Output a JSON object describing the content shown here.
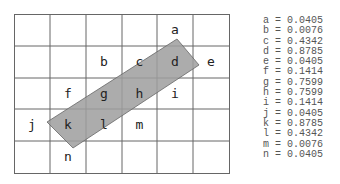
{
  "grid": {
    "cols": 6,
    "rows": 5
  },
  "cells": [
    {
      "id": "a",
      "label": "a",
      "col": 4,
      "row": 0
    },
    {
      "id": "b",
      "label": "b",
      "col": 2,
      "row": 1
    },
    {
      "id": "c",
      "label": "c",
      "col": 3,
      "row": 1
    },
    {
      "id": "d",
      "label": "d",
      "col": 4,
      "row": 1
    },
    {
      "id": "e",
      "label": "e",
      "col": 5,
      "row": 1
    },
    {
      "id": "f",
      "label": "f",
      "col": 1,
      "row": 2
    },
    {
      "id": "g",
      "label": "g",
      "col": 2,
      "row": 2
    },
    {
      "id": "h",
      "label": "h",
      "col": 3,
      "row": 2
    },
    {
      "id": "i",
      "label": "i",
      "col": 4,
      "row": 2
    },
    {
      "id": "j",
      "label": "j",
      "col": 0,
      "row": 3
    },
    {
      "id": "k",
      "label": "k",
      "col": 1,
      "row": 3
    },
    {
      "id": "l",
      "label": "l",
      "col": 2,
      "row": 3
    },
    {
      "id": "m",
      "label": "m",
      "col": 3,
      "row": 3
    },
    {
      "id": "n",
      "label": "n",
      "col": 1,
      "row": 4
    }
  ],
  "legend": [
    {
      "key": "a",
      "text": "a = 0.0405"
    },
    {
      "key": "b",
      "text": "b = 0.0076"
    },
    {
      "key": "c",
      "text": "c = 0.4342"
    },
    {
      "key": "d",
      "text": "d = 0.8785"
    },
    {
      "key": "e",
      "text": "e = 0.0405"
    },
    {
      "key": "f",
      "text": "f = 0.1414"
    },
    {
      "key": "g",
      "text": "g = 0.7599"
    },
    {
      "key": "h",
      "text": "h = 0.7599"
    },
    {
      "key": "i",
      "text": "i = 0.1414"
    },
    {
      "key": "j",
      "text": "j = 0.0405"
    },
    {
      "key": "k",
      "text": "k = 0.8785"
    },
    {
      "key": "l",
      "text": "l = 0.4342"
    },
    {
      "key": "m",
      "text": "m = 0.0076"
    },
    {
      "key": "n",
      "text": "n = 0.0405"
    }
  ],
  "colors": {
    "band_fill": "#a9a9a9",
    "grid_line": "#555555"
  }
}
